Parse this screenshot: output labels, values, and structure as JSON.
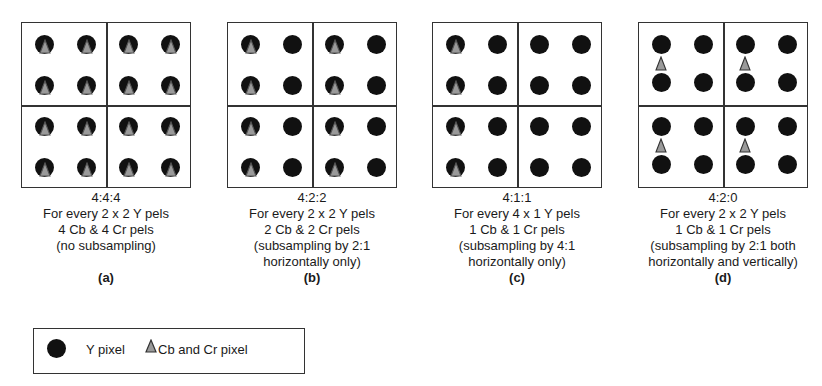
{
  "panels": [
    {
      "id": "a",
      "ratio": "4:4:4",
      "line1": "For every 2 x 2 Y pels",
      "line2": "4 Cb & 4 Cr pels",
      "line3": "(no subsampling)",
      "line4": "",
      "label": "(a)",
      "chroma_pattern": "every-pixel"
    },
    {
      "id": "b",
      "ratio": "4:2:2",
      "line1": "For every 2 x 2 Y pels",
      "line2": "2 Cb & 2 Cr pels",
      "line3": "(subsampling by 2:1",
      "line4": "horizontally only)",
      "label": "(b)",
      "chroma_pattern": "every-other-column"
    },
    {
      "id": "c",
      "ratio": "4:1:1",
      "line1": "For every 4 x 1 Y pels",
      "line2": "1 Cb & 1 Cr pels",
      "line3": "(subsampling by 4:1",
      "line4": "horizontally only)",
      "label": "(c)",
      "chroma_pattern": "first-of-four-columns"
    },
    {
      "id": "d",
      "ratio": "4:2:0",
      "line1": "For every 2 x 2 Y pels",
      "line2": "1 Cb & 1 Cr pels",
      "line3": "(subsampling by 2:1 both",
      "line4": "horizontally and vertically)",
      "label": "(d)",
      "chroma_pattern": "between-rows-per-2x2"
    }
  ],
  "legend": {
    "y_label": "Y pixel",
    "cbcr_label": "Cb and Cr pixel",
    "y_icon": "filled-black-circle",
    "cbcr_icon": "gray-triangle"
  },
  "colors": {
    "y_pixel": "#111111",
    "cbcr_pixel": "#9a9a9a",
    "border": "#333333"
  }
}
